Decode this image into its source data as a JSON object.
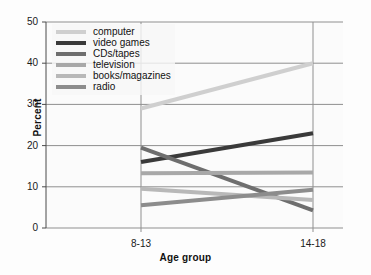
{
  "chart_data": {
    "type": "line",
    "title": "",
    "xlabel": "Age group",
    "ylabel": "Percent",
    "categories": [
      "8-13",
      "14-18"
    ],
    "x": [
      "8-13",
      "14-18"
    ],
    "ylim": [
      0,
      50
    ],
    "yticks": [
      0,
      10,
      20,
      30,
      40,
      50
    ],
    "grid": true,
    "legend_position": "upper-left",
    "series": [
      {
        "name": "computer",
        "values": [
          29,
          40
        ],
        "color": "#cfcfcf"
      },
      {
        "name": "video games",
        "values": [
          16,
          23
        ],
        "color": "#3a3a3a"
      },
      {
        "name": "CDs/tapes",
        "values": [
          19.5,
          4.3
        ],
        "color": "#6e6e6e"
      },
      {
        "name": "television",
        "values": [
          13.3,
          13.5
        ],
        "color": "#a8a8a8"
      },
      {
        "name": "books/magazines",
        "values": [
          9.5,
          6.8
        ],
        "color": "#b8b8b8"
      },
      {
        "name": "radio",
        "values": [
          5.5,
          9.3
        ],
        "color": "#8c8c8c"
      }
    ]
  },
  "axes": {
    "ylabel": "Percent",
    "xlabel": "Age group",
    "ytick_labels": [
      "50",
      "40",
      "30",
      "20",
      "10",
      "0"
    ],
    "xtick_labels": [
      "8-13",
      "14-18"
    ]
  },
  "legend": {
    "items": [
      {
        "label": "computer"
      },
      {
        "label": "video games"
      },
      {
        "label": "CDs/tapes"
      },
      {
        "label": "television"
      },
      {
        "label": "books/magazines"
      },
      {
        "label": "radio"
      }
    ]
  }
}
